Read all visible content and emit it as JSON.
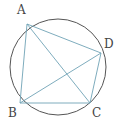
{
  "diagram": {
    "colors": {
      "circle": "#555555",
      "segments": "#6fa3b5",
      "labels": "#444444"
    },
    "circle": {
      "cx": 58,
      "cy": 67,
      "r": 48
    },
    "points": [
      {
        "name": "A",
        "x": 27,
        "y": 24,
        "lx": 17,
        "ly": 14
      },
      {
        "name": "B",
        "x": 20,
        "y": 103,
        "lx": 8,
        "ly": 117
      },
      {
        "name": "C",
        "x": 90,
        "y": 103,
        "lx": 92,
        "ly": 117
      },
      {
        "name": "D",
        "x": 101,
        "y": 53,
        "lx": 104,
        "ly": 48
      }
    ],
    "segments": [
      "AB",
      "BC",
      "CD",
      "DA",
      "AC",
      "BD"
    ]
  }
}
